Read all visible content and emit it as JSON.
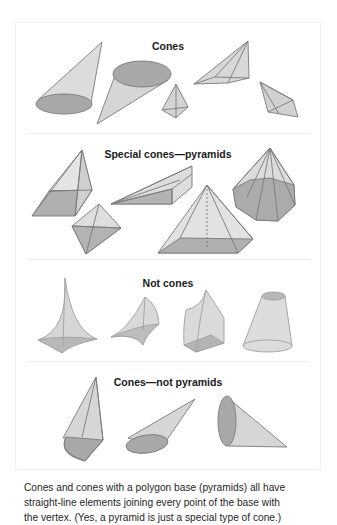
{
  "figure": {
    "sections": [
      {
        "title": "Cones",
        "shapes": [
          "oblique-circular-cone",
          "inverted-elliptical-cone",
          "small-triangular-pyramid",
          "flat-pyramid",
          "tilted-quadrilateral-pyramid"
        ]
      },
      {
        "title": "Special cones—pyramids",
        "shapes": [
          "square-pyramid-oblique",
          "rectangular-bipyramid-view",
          "elongated-wedge-pyramid",
          "square-pyramid-with-height-line",
          "octagonal-pyramid"
        ]
      },
      {
        "title": "Not cones",
        "shapes": [
          "concave-curved-pyramid",
          "curved-sail-shape",
          "dome-topped-prism",
          "frustum"
        ]
      },
      {
        "title": "Cones—not pyramids",
        "shapes": [
          "quarter-round-base-cone",
          "elliptical-cone-pointing-right",
          "circular-cone-on-side"
        ]
      }
    ],
    "colors": {
      "fill_light": "#d9d9d9",
      "fill_dark": "#a6a6a6",
      "stroke": "#7a7a7a",
      "title": "#1a1a1a"
    }
  },
  "caption": {
    "lines": [
      "Cones and cones with a polygon base (pyramids) all have",
      "straight-line elements joining every point of the base with",
      "the vertex. (Yes, a pyramid is just a special type of cone.)"
    ]
  }
}
